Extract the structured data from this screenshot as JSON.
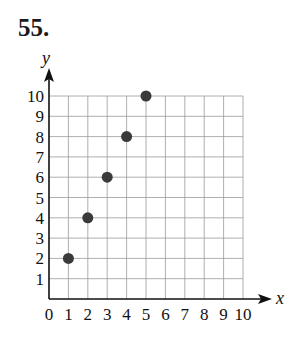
{
  "problem_number": "55.",
  "chart_data": {
    "type": "scatter",
    "title": "",
    "xlabel": "x",
    "ylabel": "y",
    "xlim": [
      0,
      10
    ],
    "ylim": [
      0,
      10
    ],
    "grid": true,
    "x_ticks": [
      "0",
      "1",
      "2",
      "3",
      "4",
      "5",
      "6",
      "7",
      "8",
      "9",
      "10"
    ],
    "y_ticks": [
      "1",
      "2",
      "3",
      "4",
      "5",
      "6",
      "7",
      "8",
      "9",
      "10"
    ],
    "points": [
      {
        "x": 1,
        "y": 2
      },
      {
        "x": 2,
        "y": 4
      },
      {
        "x": 3,
        "y": 6
      },
      {
        "x": 4,
        "y": 8
      },
      {
        "x": 5,
        "y": 10
      }
    ],
    "point_color": "#3a3a3a"
  }
}
